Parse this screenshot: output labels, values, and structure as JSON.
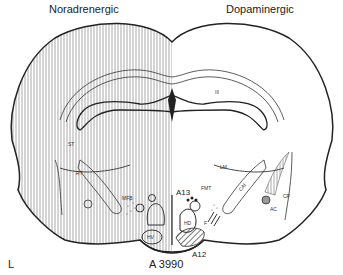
{
  "titles": {
    "left": "Noradrenergic",
    "right": "Dopaminergic"
  },
  "section_label": "A 3990",
  "corner_label": "L",
  "structure_labels": {
    "III": "III",
    "ST": "ST",
    "LM": "LM",
    "A13": "A13",
    "FMT": "FMT",
    "HD": "HD",
    "HV": "HV",
    "A12": "A12",
    "F": "F",
    "CAI": "CAI",
    "CP": "CP",
    "AC": "AC",
    "MFB": "MFB",
    "RT": "RT"
  },
  "colors": {
    "ink": "#222222",
    "background": "#ffffff"
  }
}
